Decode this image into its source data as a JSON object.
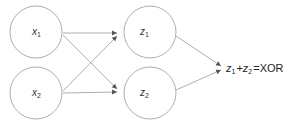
{
  "diagram": {
    "type": "neural-network",
    "nodes": [
      {
        "id": "x1",
        "base": "x",
        "sub": "1",
        "layer": "input"
      },
      {
        "id": "x2",
        "base": "x",
        "sub": "2",
        "layer": "input"
      },
      {
        "id": "z1",
        "base": "z",
        "sub": "1",
        "layer": "hidden"
      },
      {
        "id": "z2",
        "base": "z",
        "sub": "2",
        "layer": "hidden"
      }
    ],
    "edges": [
      {
        "from": "x1",
        "to": "z1"
      },
      {
        "from": "x1",
        "to": "z2"
      },
      {
        "from": "x2",
        "to": "z1"
      },
      {
        "from": "x2",
        "to": "z2"
      },
      {
        "from": "z1",
        "to": "output"
      },
      {
        "from": "z2",
        "to": "output"
      }
    ],
    "output_label": {
      "z1_base": "z",
      "z1_sub": "1",
      "plus": "+",
      "z2_base": "z",
      "z2_sub": "2",
      "equals": "=",
      "result": "XOR"
    },
    "colors": {
      "stroke": "#9a9a9a",
      "text": "#333333"
    }
  }
}
